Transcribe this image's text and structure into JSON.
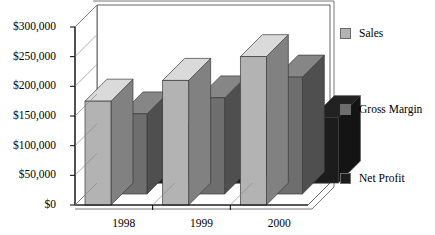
{
  "chart_data": {
    "type": "bar",
    "title": "",
    "subtitle": "",
    "xlabel": "",
    "ylabel": "",
    "categories": [
      "1998",
      "1999",
      "2000"
    ],
    "series": [
      {
        "name": "Sales",
        "values": [
          175000,
          210000,
          250000
        ],
        "color": "#b3b3b3"
      },
      {
        "name": "Gross Margin",
        "values": [
          135000,
          162000,
          197000
        ],
        "color": "#6e6e6e"
      },
      {
        "name": "Net Profit",
        "values": [
          65000,
          85000,
          110000
        ],
        "color": "#1c1c1c"
      }
    ],
    "ylim": [
      0,
      300000
    ],
    "ytick_values": [
      0,
      50000,
      100000,
      150000,
      200000,
      250000,
      300000
    ],
    "ytick_labels": [
      "$0",
      "$50,000",
      "$100,000",
      "$150,000",
      "$200,000",
      "$250,000",
      "$300,000"
    ],
    "grid": false,
    "three_d": true,
    "legend_position": "right",
    "legend": [
      {
        "label": "Sales",
        "color": "#b3b3b3"
      },
      {
        "label": "Gross Margin",
        "color": "#6e6e6e"
      },
      {
        "label": "Net Profit",
        "color": "#1c1c1c"
      }
    ]
  },
  "colors": {
    "background": "#ffffff",
    "axis": "#000000",
    "frame": "#4d4d4d",
    "series_sales": "#b3b3b3",
    "series_gross_margin": "#6e6e6e",
    "series_net_profit": "#1c1c1c"
  }
}
